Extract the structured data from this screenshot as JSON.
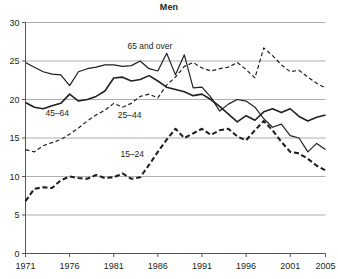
{
  "chart_data": {
    "type": "line",
    "title": "Men",
    "xlabel": "",
    "ylabel": "",
    "xlim": [
      1971,
      2005
    ],
    "ylim": [
      0,
      30
    ],
    "grid": true,
    "legend": "inline-annotations",
    "x": [
      1971,
      1972,
      1973,
      1974,
      1975,
      1976,
      1977,
      1978,
      1979,
      1980,
      1981,
      1982,
      1983,
      1984,
      1985,
      1986,
      1987,
      1988,
      1989,
      1990,
      1991,
      1992,
      1993,
      1994,
      1995,
      1996,
      1997,
      1998,
      1999,
      2000,
      2001,
      2002,
      2003,
      2004,
      2005
    ],
    "xticks": [
      "1971",
      "1976",
      "1981",
      "1986",
      "1991",
      "1996",
      "2001",
      "2005"
    ],
    "yticks": [
      "0",
      "5",
      "10",
      "15",
      "20",
      "25",
      "30"
    ],
    "series": [
      {
        "name": "65 and over",
        "style": "solid-thin",
        "label": "65 and over",
        "label_x": 1985.1,
        "label_y": 26.6,
        "color": "#231f20",
        "values": [
          24.8,
          24.2,
          23.6,
          23.3,
          23.2,
          21.8,
          23.6,
          24.0,
          24.2,
          24.5,
          24.5,
          24.3,
          24.4,
          25.0,
          24.0,
          23.7,
          26.0,
          23.2,
          25.8,
          21.5,
          21.6,
          20.3,
          18.5,
          19.4,
          20.0,
          19.8,
          19.0,
          17.5,
          16.4,
          16.8,
          15.3,
          15.0,
          13.2,
          14.3,
          13.5
        ]
      },
      {
        "name": "45-64",
        "style": "solid-thick",
        "label": "45–64",
        "label_x": 1974.6,
        "label_y": 17.8,
        "color": "#231f20",
        "values": [
          19.6,
          19.0,
          18.8,
          19.2,
          19.5,
          20.7,
          19.8,
          20.0,
          20.4,
          21.1,
          22.8,
          22.9,
          22.4,
          22.6,
          23.1,
          22.4,
          21.6,
          21.3,
          21.0,
          20.5,
          20.7,
          20.0,
          19.1,
          18.1,
          17.1,
          17.9,
          17.3,
          18.4,
          18.8,
          18.3,
          18.8,
          17.8,
          17.2,
          17.7,
          18.0
        ]
      },
      {
        "name": "25-44",
        "style": "dashed-thin",
        "label": "25–44",
        "label_x": 1982.8,
        "label_y": 17.6,
        "color": "#231f20",
        "values": [
          13.5,
          13.2,
          14.0,
          14.4,
          14.8,
          15.5,
          16.3,
          17.2,
          18.0,
          18.6,
          19.5,
          19.0,
          19.5,
          20.4,
          20.7,
          20.2,
          21.9,
          22.9,
          24.3,
          24.8,
          24.1,
          23.7,
          24.0,
          24.2,
          24.8,
          23.9,
          22.8,
          26.7,
          25.7,
          24.5,
          23.6,
          23.8,
          22.9,
          22.1,
          21.5
        ]
      },
      {
        "name": "15-24",
        "style": "dashed-thick",
        "label": "15–24",
        "label_x": 1983.1,
        "label_y": 12.5,
        "color": "#231f20",
        "values": [
          6.8,
          8.4,
          8.6,
          8.5,
          9.5,
          10.0,
          9.8,
          9.7,
          10.2,
          9.8,
          9.9,
          10.4,
          9.7,
          9.9,
          11.5,
          13.2,
          14.8,
          16.2,
          15.0,
          15.6,
          16.2,
          15.4,
          16.0,
          16.2,
          15.2,
          14.7,
          16.0,
          17.2,
          16.0,
          14.5,
          13.2,
          13.0,
          12.3,
          11.4,
          10.8
        ]
      }
    ]
  },
  "axes": {
    "y_axis_name": "y-axis",
    "x_axis_name": "x-axis"
  }
}
